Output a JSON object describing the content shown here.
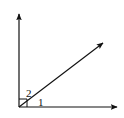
{
  "diagram": {
    "type": "angle-diagram",
    "colors": {
      "stroke": "#111111",
      "background": "#ffffff"
    },
    "vertex": {
      "x": 19,
      "y": 107
    },
    "rays": [
      {
        "name": "vertical-ray",
        "to": {
          "x": 19,
          "y": 13
        }
      },
      {
        "name": "horizontal-ray",
        "to": {
          "x": 118,
          "y": 107
        }
      },
      {
        "name": "diagonal-ray",
        "to": {
          "x": 104,
          "y": 42
        }
      }
    ],
    "right_angle_mark": {
      "size": 8
    },
    "labels": {
      "angle_2": "2",
      "angle_1": "1"
    }
  }
}
